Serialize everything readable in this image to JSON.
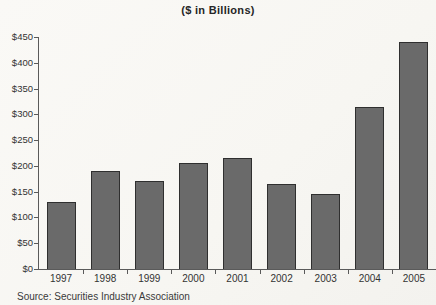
{
  "colors": {
    "bar_fill": "#6a6a6a",
    "bar_border": "#2f2f2f",
    "axis": "#5a5a5a",
    "text": "#333333",
    "background": "#f8f7f3"
  },
  "chart_data": {
    "type": "bar",
    "title": "($ in Billions)",
    "categories": [
      "1997",
      "1998",
      "1999",
      "2000",
      "2001",
      "2002",
      "2003",
      "2004",
      "2005"
    ],
    "values": [
      130,
      190,
      170,
      205,
      215,
      165,
      145,
      315,
      440
    ],
    "xlabel": "",
    "ylabel": "",
    "ylim": [
      0,
      450
    ],
    "ytick_step": 50,
    "ytick_labels": [
      "$0",
      "$50",
      "$100",
      "$150",
      "$200",
      "$250",
      "$300",
      "$350",
      "$400",
      "$450"
    ],
    "grid": false,
    "legend_position": "none",
    "source_note": "Source: Securities Industry Association"
  }
}
